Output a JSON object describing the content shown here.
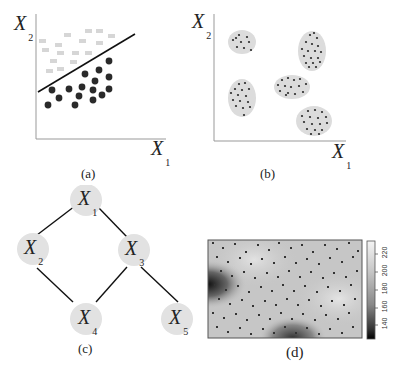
{
  "panels": {
    "a": {
      "caption": "(a)",
      "xlabel": "X",
      "xlabel_sub": "1",
      "ylabel": "X",
      "ylabel_sub": "2",
      "description": "Linear classification: light gray squares above a line, black dots below"
    },
    "b": {
      "caption": "(b)",
      "xlabel": "X",
      "xlabel_sub": "1",
      "ylabel": "X",
      "ylabel_sub": "2",
      "description": "Clustering: five gray ellipses containing dark points"
    },
    "c": {
      "caption": "(c)",
      "nodes": [
        {
          "id": "X1",
          "label": "X",
          "sub": "1"
        },
        {
          "id": "X2",
          "label": "X",
          "sub": "2"
        },
        {
          "id": "X3",
          "label": "X",
          "sub": "3"
        },
        {
          "id": "X4",
          "label": "X",
          "sub": "4"
        },
        {
          "id": "X5",
          "label": "X",
          "sub": "5"
        }
      ],
      "edges": [
        [
          "X1",
          "X2"
        ],
        [
          "X1",
          "X3"
        ],
        [
          "X2",
          "X4"
        ],
        [
          "X3",
          "X4"
        ],
        [
          "X3",
          "X5"
        ]
      ]
    },
    "d": {
      "caption": "(d)",
      "colorbar_ticks": [
        "140",
        "160",
        "180",
        "200",
        "220"
      ]
    }
  },
  "colors": {
    "dark_point": "#2a2a2a",
    "light_square": "#d6d6d6",
    "cluster_fill": "#dcdcdc",
    "node_fill": "#e2e2e2",
    "axis": "#888888",
    "line": "#111111"
  }
}
